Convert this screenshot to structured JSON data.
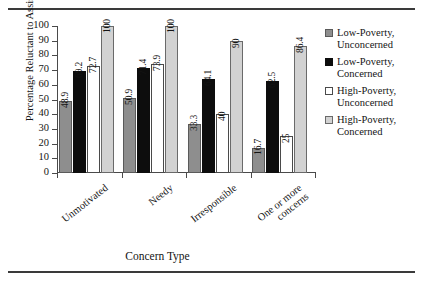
{
  "chart_data": {
    "type": "bar",
    "title": "",
    "xlabel": "Concern Type",
    "ylabel": "Percentage Reluctant to Assist",
    "ylim": [
      0,
      100
    ],
    "ytick_step": 10,
    "yticks": [
      0,
      10,
      20,
      30,
      40,
      50,
      60,
      70,
      80,
      90,
      100
    ],
    "grid": false,
    "legend_position": "right",
    "categories": [
      "Unmotivated",
      "Needy",
      "Irresponsible",
      "One or more concerns"
    ],
    "series": [
      {
        "name": "Low-Poverty, Unconcerned",
        "color": "#8e8e8e",
        "values": [
          48.9,
          50.9,
          33.3,
          16.7
        ],
        "labels": [
          "48.9",
          "50.9",
          "33.3",
          "16.7"
        ]
      },
      {
        "name": "Low-Poverty, Concerned",
        "color": "#0d0d0d",
        "values": [
          69.2,
          71.4,
          64.1,
          62.5
        ],
        "labels": [
          "69.2",
          "71.4",
          "64.1",
          "62.5"
        ]
      },
      {
        "name": "High-Poverty, Unconcerned",
        "color": "#ffffff",
        "values": [
          72.7,
          73.9,
          40,
          25
        ],
        "labels": [
          "72.7",
          "73.9",
          "40",
          "25"
        ]
      },
      {
        "name": "High-Poverty, Concerned",
        "color": "#d2d2d2",
        "values": [
          100,
          100,
          90,
          86.4
        ],
        "labels": [
          "100",
          "100",
          "90",
          "86.4"
        ]
      }
    ]
  },
  "legend": {
    "items": [
      {
        "line1": "Low-Poverty,",
        "line2": "Unconcerned"
      },
      {
        "line1": "Low-Poverty,",
        "line2": "Concerned"
      },
      {
        "line1": "High-Poverty,",
        "line2": "Unconcerned"
      },
      {
        "line1": "High-Poverty,",
        "line2": "Concerned"
      }
    ]
  },
  "xcat_lines": [
    {
      "line1": "Unmotivated",
      "line2": ""
    },
    {
      "line1": "Needy",
      "line2": ""
    },
    {
      "line1": "Irresponsible",
      "line2": ""
    },
    {
      "line1": "One or more",
      "line2": "concerns"
    }
  ]
}
